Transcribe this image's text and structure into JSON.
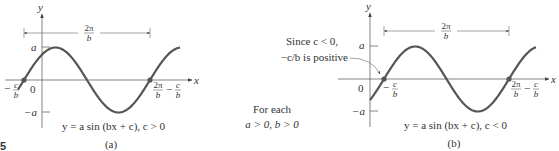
{
  "figure": {
    "marker": "5",
    "panels": [
      {
        "id": "a",
        "caption": "(a)",
        "equation": "y = a sin (bx + c), c > 0",
        "axis_x_label": "x",
        "axis_y_label": "y",
        "y_max_label": "a",
        "y_min_label": "−a",
        "origin_label": "0",
        "period_label_num": "2π",
        "period_label_den": "b",
        "left_crossing_label": "−",
        "left_crossing_num": "c",
        "left_crossing_den": "b",
        "right_crossing_num1": "2π",
        "right_crossing_den1": "b",
        "right_crossing_minus": "−",
        "right_crossing_num2": "c",
        "right_crossing_den2": "b"
      },
      {
        "id": "b",
        "caption": "(b)",
        "equation": "y = a sin (bx + c), c < 0",
        "axis_x_label": "x",
        "axis_y_label": "y",
        "y_max_label": "a",
        "y_min_label": "−a",
        "origin_label": "0",
        "period_label_num": "2π",
        "period_label_den": "b",
        "left_crossing_label": "−",
        "left_crossing_num": "c",
        "left_crossing_den": "b",
        "right_crossing_num1": "2π",
        "right_crossing_den1": "b",
        "right_crossing_minus": "−",
        "right_crossing_num2": "c",
        "right_crossing_den2": "b",
        "annotation_line1": "Since c < 0,",
        "annotation_line2": "−c/b is positive"
      }
    ],
    "note_line1": "For each",
    "note_line2": "a > 0, b > 0",
    "colors": {
      "curve": "#555555",
      "axis": "#555555",
      "text": "#333333"
    }
  }
}
